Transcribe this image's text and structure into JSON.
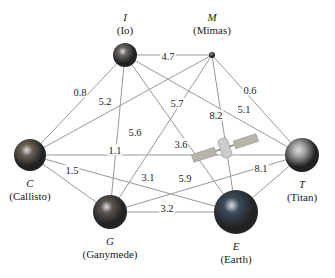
{
  "nodes": [
    {
      "id": "I",
      "letter": "I",
      "name": "(Io)",
      "x": 125,
      "y": 55,
      "r": 12,
      "color": "#6a6560"
    },
    {
      "id": "M",
      "letter": "M",
      "name": "(Mimas)",
      "x": 212,
      "y": 55,
      "r": 3,
      "color": "#555"
    },
    {
      "id": "C",
      "letter": "C",
      "name": "(Callisto)",
      "x": 30,
      "y": 155,
      "r": 16,
      "color": "#6e6258"
    },
    {
      "id": "T",
      "letter": "T",
      "name": "(Titan)",
      "x": 302,
      "y": 155,
      "r": 17,
      "color": "#a8a8a8"
    },
    {
      "id": "G",
      "letter": "G",
      "name": "(Ganymede)",
      "x": 110,
      "y": 212,
      "r": 17,
      "color": "#5b544d"
    },
    {
      "id": "E",
      "letter": "E",
      "name": "(Earth)",
      "x": 236,
      "y": 212,
      "r": 22,
      "color": "#3a4c5c"
    }
  ],
  "edges": [
    {
      "from": "I",
      "to": "M",
      "weight": "4.7",
      "lx": 168,
      "ly": 56
    },
    {
      "from": "I",
      "to": "C",
      "weight": "0.8",
      "lx": 80,
      "ly": 92
    },
    {
      "from": "M",
      "to": "C",
      "weight": "5.2",
      "lx": 105,
      "ly": 101
    },
    {
      "from": "I",
      "to": "T",
      "weight": "5.1",
      "lx": 244,
      "ly": 109
    },
    {
      "from": "M",
      "to": "T",
      "weight": "0.6",
      "lx": 250,
      "ly": 90
    },
    {
      "from": "C",
      "to": "T",
      "weight": "5.6",
      "lx": 135,
      "ly": 132
    },
    {
      "from": "I",
      "to": "G",
      "weight": "1.1",
      "lx": 115,
      "ly": 150
    },
    {
      "from": "M",
      "to": "G",
      "weight": "5.7",
      "lx": 177,
      "ly": 103
    },
    {
      "from": "I",
      "to": "E",
      "weight": "3.6",
      "lx": 181,
      "ly": 144
    },
    {
      "from": "M",
      "to": "E",
      "weight": "8.2",
      "lx": 216,
      "ly": 115
    },
    {
      "from": "C",
      "to": "G",
      "weight": "1.5",
      "lx": 72,
      "ly": 170
    },
    {
      "from": "C",
      "to": "E",
      "weight": "3.1",
      "lx": 148,
      "ly": 177
    },
    {
      "from": "G",
      "to": "T",
      "weight": "5.9",
      "lx": 185,
      "ly": 178
    },
    {
      "from": "G",
      "to": "E",
      "weight": "3.2",
      "lx": 167,
      "ly": 208
    },
    {
      "from": "E",
      "to": "T",
      "weight": "8.1",
      "lx": 261,
      "ly": 168
    }
  ],
  "satellite": {
    "x": 225,
    "y": 148
  }
}
